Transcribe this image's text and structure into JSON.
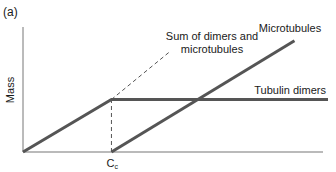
{
  "chart_data": {
    "type": "line",
    "panel_label": "(a)",
    "title": "",
    "xlabel": "",
    "ylabel": "Mass",
    "xlim": [
      0,
      1
    ],
    "ylim": [
      0,
      1
    ],
    "grid": false,
    "x_ticks": [
      {
        "x": 0.29,
        "label": "C",
        "subscript": "c"
      }
    ],
    "series": [
      {
        "name": "Tubulin dimers",
        "style": "solid",
        "color": "#555555",
        "points": [
          [
            0,
            0
          ],
          [
            0.29,
            0.42
          ],
          [
            1.0,
            0.42
          ]
        ]
      },
      {
        "name": "Microtubules",
        "style": "solid",
        "color": "#555555",
        "points": [
          [
            0.29,
            0
          ],
          [
            0.89,
            0.89
          ]
        ]
      },
      {
        "name": "Sum of dimers and microtubules",
        "style": "dashed",
        "color": "#555555",
        "points": [
          [
            0.29,
            0.42
          ],
          [
            0.48,
            0.8
          ]
        ]
      },
      {
        "name": "Cc marker",
        "style": "dashed",
        "color": "#555555",
        "points": [
          [
            0.29,
            0
          ],
          [
            0.29,
            0.42
          ]
        ]
      }
    ],
    "annotations": [
      {
        "text_lines": [
          "Sum of dimers and",
          "microtubules"
        ],
        "target": "Sum of dimers and microtubules"
      },
      {
        "text_lines": [
          "Microtubules"
        ],
        "target": "Microtubules"
      },
      {
        "text_lines": [
          "Tubulin dimers"
        ],
        "target": "Tubulin dimers"
      }
    ]
  }
}
